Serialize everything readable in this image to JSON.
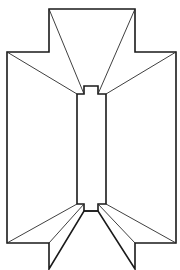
{
  "diagram": {
    "type": "line-drawing",
    "colors": {
      "stroke": "#1a1a1a",
      "background": "#ffffff"
    },
    "outline_points": "49,9 135,9 135,52 176,52 176,243 135,243 135,269 98,211 84,211 49,269 49,243 7,243 7,52 49,52",
    "inner_slot_points": "84,86 98,86 98,94 106,94 106,204 98,204 98,211 84,211 84,204 77,204 77,94 84,94",
    "fold_lines": [
      {
        "x1": 49,
        "y1": 9,
        "x2": 84,
        "y2": 94
      },
      {
        "x1": 7,
        "y1": 52,
        "x2": 77,
        "y2": 94
      },
      {
        "x1": 135,
        "y1": 9,
        "x2": 98,
        "y2": 94
      },
      {
        "x1": 176,
        "y1": 52,
        "x2": 106,
        "y2": 94
      },
      {
        "x1": 49,
        "y1": 243,
        "x2": 84,
        "y2": 204
      },
      {
        "x1": 7,
        "y1": 243,
        "x2": 77,
        "y2": 204
      },
      {
        "x1": 135,
        "y1": 243,
        "x2": 98,
        "y2": 204
      },
      {
        "x1": 176,
        "y1": 243,
        "x2": 106,
        "y2": 204
      }
    ]
  }
}
